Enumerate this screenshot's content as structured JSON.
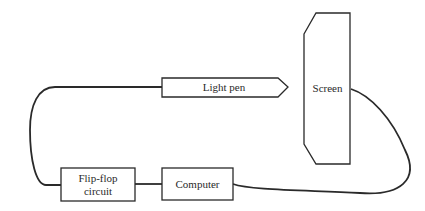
{
  "diagram": {
    "title": "",
    "nodes": [
      {
        "id": "light-pen",
        "label": "Light pen",
        "shape": "pentagon-arrow"
      },
      {
        "id": "screen",
        "label": "Screen",
        "shape": "chamfered-rectangle"
      },
      {
        "id": "flip-flop",
        "label_line1": "Flip-flop",
        "label_line2": "circuit",
        "shape": "rectangle"
      },
      {
        "id": "computer",
        "label": "Computer",
        "shape": "rectangle"
      }
    ],
    "edges": [
      {
        "from": "light-pen",
        "to": "flip-flop",
        "style": "curved-wire"
      },
      {
        "from": "flip-flop",
        "to": "computer",
        "style": "straight-wire"
      },
      {
        "from": "computer",
        "to": "screen",
        "style": "curved-wire"
      }
    ],
    "colors": {
      "stroke": "#2a2a2a",
      "background": "#ffffff"
    }
  }
}
